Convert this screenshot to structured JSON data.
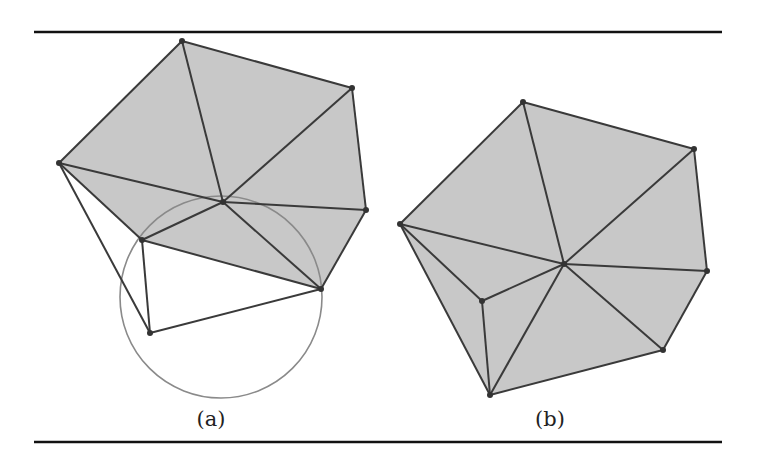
{
  "figure": {
    "rules": {
      "top_y": 32,
      "bottom_y": 442,
      "x1": 34,
      "x2": 722,
      "color": "#111111"
    },
    "colors": {
      "fill": "#c8c8c8",
      "edge": "#3a3a3a",
      "circle": "#8a8a8a",
      "vertex": "#333333"
    },
    "panels": [
      {
        "label": "(a)",
        "label_pos": [
          211,
          421
        ],
        "vertices": {
          "L": [
            59,
            163
          ],
          "T": [
            182,
            41
          ],
          "UR": [
            352,
            88
          ],
          "R": [
            366,
            210
          ],
          "LR": [
            321,
            289
          ],
          "I": [
            142,
            240
          ],
          "B": [
            150,
            333
          ],
          "C": [
            223,
            202
          ]
        },
        "shaded_polygon": [
          "L",
          "T",
          "UR",
          "R",
          "LR",
          "I"
        ],
        "edges": [
          [
            "L",
            "T"
          ],
          [
            "T",
            "UR"
          ],
          [
            "UR",
            "R"
          ],
          [
            "R",
            "LR"
          ],
          [
            "LR",
            "I"
          ],
          [
            "I",
            "L"
          ],
          [
            "C",
            "L"
          ],
          [
            "C",
            "T"
          ],
          [
            "C",
            "UR"
          ],
          [
            "C",
            "R"
          ],
          [
            "C",
            "LR"
          ],
          [
            "C",
            "I"
          ],
          [
            "L",
            "B"
          ],
          [
            "I",
            "B"
          ],
          [
            "B",
            "LR"
          ]
        ],
        "circle": {
          "cx": 221,
          "cy": 297,
          "r": 101
        }
      },
      {
        "label": "(b)",
        "label_pos": [
          550,
          421
        ],
        "vertices": {
          "T": [
            523,
            102
          ],
          "UR": [
            694,
            149
          ],
          "R": [
            707,
            271
          ],
          "LR": [
            663,
            350
          ],
          "B": [
            490,
            395
          ],
          "I": [
            482,
            301
          ],
          "L": [
            400,
            224
          ],
          "C": [
            564,
            264
          ]
        },
        "shaded_polygon": [
          "L",
          "T",
          "UR",
          "R",
          "LR",
          "B"
        ],
        "edges": [
          [
            "L",
            "T"
          ],
          [
            "T",
            "UR"
          ],
          [
            "UR",
            "R"
          ],
          [
            "R",
            "LR"
          ],
          [
            "LR",
            "B"
          ],
          [
            "B",
            "L"
          ],
          [
            "C",
            "T"
          ],
          [
            "C",
            "UR"
          ],
          [
            "C",
            "R"
          ],
          [
            "C",
            "LR"
          ],
          [
            "C",
            "B"
          ],
          [
            "C",
            "I"
          ],
          [
            "C",
            "L"
          ],
          [
            "L",
            "I"
          ],
          [
            "I",
            "B"
          ]
        ],
        "circle": null
      }
    ]
  }
}
